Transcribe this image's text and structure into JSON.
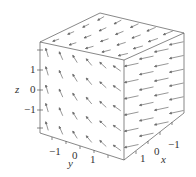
{
  "chart_data": {
    "type": "vector-field-3d",
    "title": "",
    "axes": {
      "x": {
        "label": "x",
        "ticks": [
          "1",
          "0",
          "-1"
        ],
        "range": [
          -1.8,
          1.8
        ]
      },
      "y": {
        "label": "y",
        "ticks": [
          "-1",
          "0",
          "1"
        ],
        "range": [
          -1.8,
          1.8
        ]
      },
      "z": {
        "label": "z",
        "ticks": [
          "1",
          "0",
          "-1"
        ],
        "range": [
          -1.8,
          1.8
        ]
      }
    },
    "box": true,
    "grid": false,
    "legend": null
  },
  "labels": {
    "z_axis": "z",
    "y_axis": "y",
    "x_axis": "x",
    "z_ticks": [
      "1",
      "0",
      "−1"
    ],
    "y_ticks": [
      "−1",
      "0",
      "1"
    ],
    "x_ticks": [
      "1",
      "0",
      "−1"
    ]
  },
  "colors": {
    "box": "#555555",
    "arrows": "#6a6a6a",
    "text": "#333333"
  }
}
